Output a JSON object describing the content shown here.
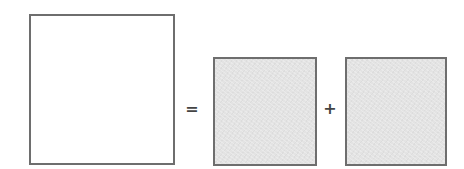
{
  "diagram": {
    "operators": {
      "equals": "=",
      "plus": "+"
    },
    "boxes": [
      {
        "role": "left-hand-side",
        "fill": "#ffffff",
        "border": "#6e6e6e"
      },
      {
        "role": "term-1",
        "fill": "#e3e3e3",
        "border": "#6e6e6e"
      },
      {
        "role": "term-2",
        "fill": "#e3e3e3",
        "border": "#6e6e6e"
      }
    ]
  }
}
